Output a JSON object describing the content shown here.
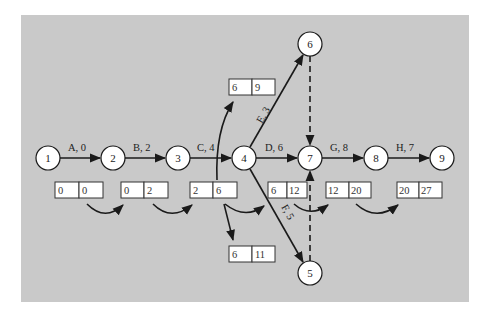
{
  "diagram": {
    "type": "activity-on-arrow network (critical path forward pass)",
    "background_color": "#c9c9c9",
    "nodes": [
      {
        "id": "1",
        "label": "1",
        "x": 48,
        "y": 158
      },
      {
        "id": "2",
        "label": "2",
        "x": 113,
        "y": 158
      },
      {
        "id": "3",
        "label": "3",
        "x": 178,
        "y": 158
      },
      {
        "id": "4",
        "label": "4",
        "x": 244,
        "y": 158
      },
      {
        "id": "5",
        "label": "5",
        "x": 310,
        "y": 273
      },
      {
        "id": "6",
        "label": "6",
        "x": 310,
        "y": 44
      },
      {
        "id": "7",
        "label": "7",
        "x": 310,
        "y": 158
      },
      {
        "id": "8",
        "label": "8",
        "x": 376,
        "y": 158
      },
      {
        "id": "9",
        "label": "9",
        "x": 442,
        "y": 158
      }
    ],
    "activities": [
      {
        "from": "1",
        "to": "2",
        "label": "A, 0",
        "style": "solid"
      },
      {
        "from": "2",
        "to": "3",
        "label": "B, 2",
        "style": "solid"
      },
      {
        "from": "3",
        "to": "4",
        "label": "C, 4",
        "style": "solid"
      },
      {
        "from": "4",
        "to": "7",
        "label": "D, 6",
        "style": "solid"
      },
      {
        "from": "4",
        "to": "6",
        "label": "E, 3",
        "style": "solid"
      },
      {
        "from": "4",
        "to": "5",
        "label": "F, 5",
        "style": "solid"
      },
      {
        "from": "7",
        "to": "8",
        "label": "G, 8",
        "style": "solid"
      },
      {
        "from": "8",
        "to": "9",
        "label": "H, 7",
        "style": "solid"
      },
      {
        "from": "6",
        "to": "7",
        "label": "",
        "style": "dashed"
      },
      {
        "from": "5",
        "to": "7",
        "label": "",
        "style": "dashed"
      }
    ],
    "time_boxes": [
      {
        "activity": "A",
        "start": "0",
        "finish": "0"
      },
      {
        "activity": "B",
        "start": "0",
        "finish": "2"
      },
      {
        "activity": "C",
        "start": "2",
        "finish": "6"
      },
      {
        "activity": "E",
        "start": "6",
        "finish": "9"
      },
      {
        "activity": "D",
        "start": "6",
        "finish": "12"
      },
      {
        "activity": "F",
        "start": "6",
        "finish": "11"
      },
      {
        "activity": "G",
        "start": "12",
        "finish": "20"
      },
      {
        "activity": "H",
        "start": "20",
        "finish": "27"
      }
    ]
  }
}
